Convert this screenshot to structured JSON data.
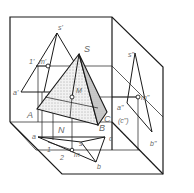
{
  "diagram": {
    "colors": {
      "line": "#1a1a1a",
      "label": "#666666",
      "shade_face": "#e6e6e6",
      "shade_face_dark": "#cfcfcf",
      "background": "#ffffff"
    },
    "labels": {
      "s_prime": "s'",
      "one_prime": "1'",
      "m_prime": "m'",
      "a_prime": "a'",
      "S": "S",
      "M": "M",
      "A": "A",
      "B": "B",
      "C": "C",
      "N": "N",
      "s_dprime": "s\"",
      "m_dprime": "m\"",
      "a_dprime": "a\"",
      "c_dprime": "(c\")",
      "b_dprime": "b\"",
      "a": "a",
      "b": "b",
      "c": "c",
      "s": "s",
      "m": "m",
      "one": "1",
      "two": "2"
    }
  }
}
